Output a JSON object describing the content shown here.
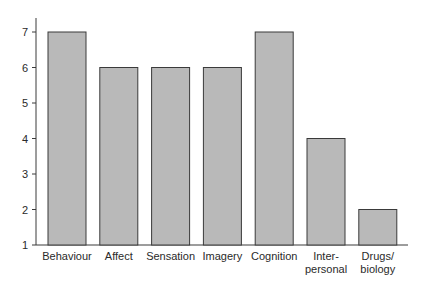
{
  "chart_data": {
    "type": "bar",
    "title": "",
    "xlabel": "",
    "ylabel": "",
    "categories": [
      "Behaviour",
      "Affect",
      "Sensation",
      "Imagery",
      "Cognition",
      "Inter-personal",
      "Drugs/biology"
    ],
    "category_label_lines": [
      [
        "Behaviour"
      ],
      [
        "Affect"
      ],
      [
        "Sensation"
      ],
      [
        "Imagery"
      ],
      [
        "Cognition"
      ],
      [
        "Inter-",
        "personal"
      ],
      [
        "Drugs/",
        "biology"
      ]
    ],
    "values": [
      7,
      6,
      6,
      6,
      7,
      4,
      2
    ],
    "ylim": [
      1,
      7
    ],
    "yticks": [
      1,
      2,
      3,
      4,
      5,
      6,
      7
    ],
    "grid": false,
    "legend": null,
    "colors": {
      "bar_fill": "#b9b9b9",
      "bar_stroke": "#3a3a3a",
      "axis": "#3a3a3a"
    }
  }
}
